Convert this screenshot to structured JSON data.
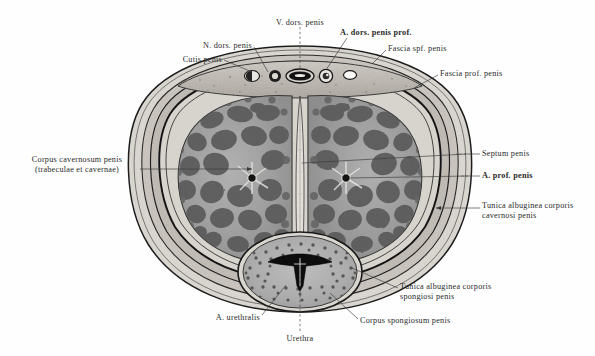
{
  "figure": {
    "modality": "grayscale anatomical plate",
    "background_color": "#fefefe",
    "ink_color": "#2a2a2a"
  },
  "labels": [
    {
      "id": "cutis-penis",
      "text": "Cutis penis",
      "align": "right",
      "x": 130,
      "y": 55,
      "w": 92,
      "leader": [
        [
          224,
          60
        ],
        [
          252,
          72
        ]
      ]
    },
    {
      "id": "n-dors-penis",
      "text": "N. dors. penis",
      "align": "right",
      "x": 150,
      "y": 41,
      "w": 102,
      "leader": [
        [
          254,
          47
        ],
        [
          268,
          72
        ]
      ]
    },
    {
      "id": "v-dors-penis",
      "text": "V. dors. penis",
      "align": "center",
      "x": 258,
      "y": 18,
      "w": 84,
      "leader": [
        [
          300,
          27
        ],
        [
          300,
          68
        ]
      ],
      "dashed": true
    },
    {
      "id": "a-dors-penis-prof",
      "text": "A. dors. penis prof.",
      "align": "left",
      "x": 340,
      "y": 28,
      "w": 106,
      "bold": true,
      "leader": [
        [
          347,
          38
        ],
        [
          326,
          70
        ]
      ]
    },
    {
      "id": "fascia-spf-penis",
      "text": "Fascia spf. penis",
      "align": "left",
      "x": 388,
      "y": 44,
      "w": 92,
      "leader": [
        [
          386,
          50
        ],
        [
          372,
          64
        ]
      ]
    },
    {
      "id": "fascia-prof-penis",
      "text": "Fascia prof. penis",
      "align": "left",
      "x": 440,
      "y": 69,
      "w": 96,
      "leader": [
        [
          438,
          75
        ],
        [
          414,
          88
        ]
      ]
    },
    {
      "id": "septum-penis",
      "text": "Septum penis",
      "align": "left",
      "x": 482,
      "y": 149,
      "w": 80,
      "leader": [
        [
          480,
          154
        ],
        [
          300,
          163
        ]
      ],
      "dashed_head": true
    },
    {
      "id": "a-prof-penis",
      "text": "A. prof. penis",
      "align": "left",
      "x": 482,
      "y": 171,
      "w": 80,
      "bold": true,
      "leader": [
        [
          480,
          176
        ],
        [
          346,
          178
        ]
      ],
      "dashed_head": true
    },
    {
      "id": "tunica-alb-cavernosi",
      "text": "Tunica albuginea corporis\ncavernosi penis",
      "align": "left",
      "x": 482,
      "y": 201,
      "w": 110,
      "leader": [
        [
          480,
          208
        ],
        [
          436,
          208
        ]
      ]
    },
    {
      "id": "tunica-alb-spongiosi",
      "text": "Tunica albuginea corporis\nspongiosi penis",
      "align": "left",
      "x": 400,
      "y": 282,
      "w": 112,
      "leader": [
        [
          398,
          288
        ],
        [
          352,
          268
        ]
      ]
    },
    {
      "id": "corpus-spongiosum",
      "text": "Corpus spongiosum penis",
      "align": "left",
      "x": 360,
      "y": 316,
      "w": 118,
      "leader": [
        [
          358,
          319
        ],
        [
          330,
          293
        ]
      ]
    },
    {
      "id": "a-urethralis",
      "text": "A. urethralis",
      "align": "right",
      "x": 190,
      "y": 313,
      "w": 70,
      "leader": [
        [
          262,
          315
        ],
        [
          286,
          285
        ]
      ]
    },
    {
      "id": "urethra",
      "text": "Urethra",
      "align": "center",
      "x": 272,
      "y": 334,
      "w": 56,
      "leader": [
        [
          300,
          331
        ],
        [
          300,
          277
        ]
      ],
      "dashed": true
    },
    {
      "id": "corpus-cavernosum",
      "text": "Corpus cavernosum penis\n(trabeculae et cavernae)",
      "align": "right",
      "x": 18,
      "y": 155,
      "w": 118,
      "leader": [
        [
          140,
          169
        ],
        [
          252,
          169
        ]
      ]
    }
  ],
  "structures": {
    "layers": [
      {
        "name": "cutis-penis",
        "label": "Cutis penis"
      },
      {
        "name": "fascia-spf-penis",
        "label": "Fascia spf. penis"
      },
      {
        "name": "fascia-prof-penis",
        "label": "Fascia prof. penis"
      },
      {
        "name": "tunica-albuginea",
        "label": "Tunica albuginea corporis cavernosi penis"
      }
    ],
    "corpora_cavernosa": 2,
    "corpus_spongiosum": 1,
    "septum": "Septum penis",
    "urethra_shape": "Y-shaped slit",
    "dorsal_vessels": [
      {
        "name": "vessel-left-pair",
        "kind": "vein"
      },
      {
        "name": "a-dors-penis-left",
        "kind": "artery"
      },
      {
        "name": "v-dors-penis",
        "kind": "deep dorsal vein"
      },
      {
        "name": "a-dors-penis-prof",
        "kind": "artery"
      },
      {
        "name": "vessel-right",
        "kind": "vein"
      }
    ],
    "deep_arteries": 2
  }
}
